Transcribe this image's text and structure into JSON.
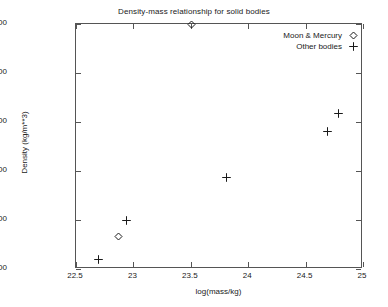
{
  "chart_data": {
    "type": "scatter",
    "title": "Density-mass relationship for solid bodies",
    "xlabel": "log(mass/kg)",
    "ylabel": "Density (kg/m**3)",
    "xlim": [
      22.5,
      25
    ],
    "ylim": [
      3000,
      5500
    ],
    "xticks": [
      "22.5",
      "23",
      "23.5",
      "24",
      "24.5",
      "25"
    ],
    "xtick_values": [
      22.5,
      23,
      23.5,
      24,
      24.5,
      25
    ],
    "yticks": [
      "3000",
      "3500",
      "4000",
      "4500",
      "5000",
      "5500"
    ],
    "ytick_values": [
      3000,
      3500,
      4000,
      4500,
      5000,
      5500
    ],
    "grid": false,
    "legend_position": "top-right",
    "series": [
      {
        "name": "Moon & Mercury",
        "marker": "diamond-open",
        "color": "#1a1a1a",
        "points": [
          {
            "x": 23.51,
            "y": 5500
          },
          {
            "x": 22.87,
            "y": 3330
          }
        ]
      },
      {
        "name": "Other bodies",
        "marker": "plus",
        "color": "#1a1a1a",
        "points": [
          {
            "x": 22.7,
            "y": 3100
          },
          {
            "x": 22.94,
            "y": 3500
          },
          {
            "x": 23.81,
            "y": 3935
          },
          {
            "x": 24.69,
            "y": 4400
          },
          {
            "x": 24.79,
            "y": 4590
          }
        ]
      }
    ]
  }
}
